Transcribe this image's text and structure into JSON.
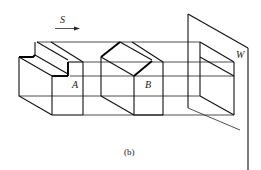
{
  "figure": {
    "caption": "(b)",
    "view_direction": {
      "label": "S",
      "icon": "arrow-right-icon"
    },
    "objects": [
      {
        "id": "A",
        "label": "A",
        "description": "stepped block (L-shaped profile)"
      },
      {
        "id": "B",
        "label": "B",
        "description": "block with chamfered/sloped top edge"
      }
    ],
    "projection_plane": {
      "label": "W",
      "description": "side projection plane"
    },
    "colors": {
      "line": "#000000",
      "background": "#ffffff"
    }
  }
}
